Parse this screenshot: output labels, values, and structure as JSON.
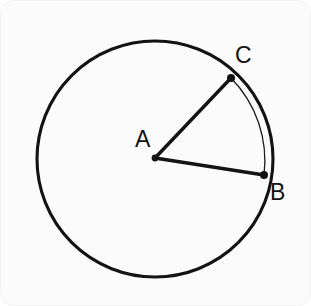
{
  "figure": {
    "background_color": "#fbfbfb",
    "stroke_color": "#131313",
    "arc_stroke_color": "#1a1a1a",
    "canvas": {
      "width": 311,
      "height": 306
    }
  },
  "circle": {
    "center_x": 155,
    "center_y": 159,
    "radius": 118,
    "stroke_width": 3.1
  },
  "points": [
    {
      "name": "A",
      "label": "A",
      "role": "center",
      "x": 155,
      "y": 158,
      "dot_radius": 3.4,
      "label_x": 135,
      "label_y": 147
    },
    {
      "name": "C",
      "label": "C",
      "role": "circumference",
      "x": 231,
      "y": 78,
      "dot_radius": 4.0,
      "label_x": 235,
      "label_y": 63
    },
    {
      "name": "B",
      "label": "B",
      "role": "circumference",
      "x": 264,
      "y": 175,
      "dot_radius": 4.0,
      "label_x": 270,
      "label_y": 200
    }
  ],
  "segments": [
    {
      "name": "radius-AC",
      "from": "A",
      "to": "C",
      "x1": 155,
      "y1": 158,
      "x2": 231,
      "y2": 78,
      "stroke_width": 3.4
    },
    {
      "name": "radius-AB",
      "from": "A",
      "to": "B",
      "x1": 155,
      "y1": 158,
      "x2": 264,
      "y2": 175,
      "stroke_width": 3.4
    }
  ],
  "arc": {
    "name": "arc-CB",
    "from": "C",
    "to": "B",
    "path": "M 231 78 A 118 118 0 0 1 264 175",
    "stroke_width": 1.3
  },
  "labels": {
    "center": "A",
    "upper_point": "C",
    "lower_point": "B"
  }
}
